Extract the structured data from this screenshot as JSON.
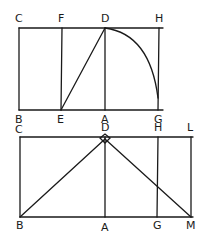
{
  "figure_top": {
    "labels": {
      "C": "C",
      "F": "F",
      "D": "D",
      "H": "H",
      "B": "B",
      "E": "E",
      "A": "A",
      "G": "G"
    },
    "description": "Rectangle CHGB with square CDAB; line FE parallel to CB; diagonal ED; arc from D to G centered at E"
  },
  "figure_bottom": {
    "labels": {
      "C": "C",
      "D": "D",
      "H": "H",
      "L": "L",
      "B": "B",
      "A": "A",
      "G": "G",
      "M": "M"
    },
    "description": "Rectangle CLMB with vertical DA and HG; lines BD and DM meet at D with right-angle marker"
  },
  "colors": {
    "ink": "#1a1a1a",
    "background": "#ffffff"
  }
}
